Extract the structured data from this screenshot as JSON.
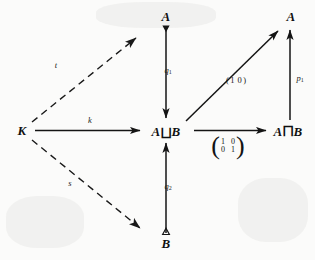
{
  "diagram": {
    "nodes": [
      {
        "id": "K",
        "label": "K",
        "x": 22,
        "y": 130
      },
      {
        "id": "A-top",
        "label": "A",
        "x": 166,
        "y": 16
      },
      {
        "id": "AsqB",
        "label": "A",
        "op": "⨆",
        "label2": "B",
        "x": 166,
        "y": 131
      },
      {
        "id": "B-bottom",
        "label": "B",
        "x": 166,
        "y": 243
      },
      {
        "id": "AcapB",
        "label": "A",
        "op": "⨅",
        "label2": "B",
        "x": 288,
        "y": 131
      },
      {
        "id": "A-right",
        "label": "A",
        "x": 291,
        "y": 16
      }
    ],
    "arrow_labels": [
      {
        "id": "t",
        "text": "t",
        "x": 56,
        "y": 65
      },
      {
        "id": "k",
        "text": "k",
        "x": 90,
        "y": 120
      },
      {
        "id": "s",
        "text": "s",
        "x": 70,
        "y": 183
      },
      {
        "id": "q1",
        "base": "q",
        "sub": "1",
        "x": 168,
        "y": 70
      },
      {
        "id": "q2",
        "base": "q",
        "sub": "2",
        "x": 168,
        "y": 186
      },
      {
        "id": "p1",
        "base": "p",
        "sub": "1",
        "x": 300,
        "y": 78
      }
    ],
    "row_matrix": {
      "id": "row-matrix-1-0",
      "open": "(",
      "cells": [
        "1",
        "0"
      ],
      "close": ")",
      "x": 236,
      "y": 80
    },
    "square_matrix": {
      "id": "identity-matrix",
      "open": "(",
      "close": ")",
      "rows": [
        [
          "1",
          "0"
        ],
        [
          "0",
          "1"
        ]
      ],
      "x": 228,
      "y": 146
    },
    "colors": {
      "ink": "#141414",
      "paper": "#fbfbfa",
      "dash": "#191919"
    }
  }
}
